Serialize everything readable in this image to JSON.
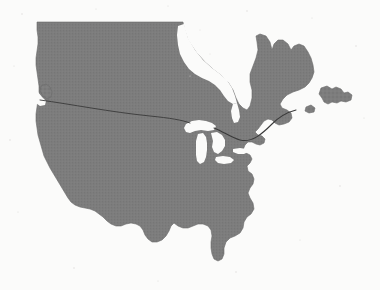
{
  "figure": {
    "kind": "map-silhouette",
    "width": 380,
    "height": 290,
    "projection_note": "contiguous United States with southern Canada"
  },
  "colors": {
    "background": "#fbfbfa",
    "land_fill": "#7d7d7d",
    "land_fill_shade": "#6f6f6f",
    "water_fill": "#fbfbfa",
    "border_line": "#3a3a3a",
    "texture_dot": "#6a6a6a",
    "speckle": "#d8d6d2"
  },
  "regions": {
    "landmass": {
      "name": "mainland",
      "label": "North American mainland"
    },
    "islands": [
      {
        "name": "vancouver-island",
        "label": "Vancouver Island"
      },
      {
        "name": "newfoundland",
        "label": "Newfoundland"
      }
    ],
    "water_bodies": [
      {
        "name": "hudson-bay",
        "label": "Hudson Bay"
      },
      {
        "name": "james-bay",
        "label": "James Bay"
      },
      {
        "name": "lake-superior",
        "label": "Lake Superior"
      },
      {
        "name": "lake-michigan",
        "label": "Lake Michigan"
      },
      {
        "name": "lake-huron",
        "label": "Lake Huron"
      },
      {
        "name": "lake-erie",
        "label": "Lake Erie"
      },
      {
        "name": "lake-ontario",
        "label": "Lake Ontario"
      },
      {
        "name": "puget-sound",
        "label": "Puget Sound"
      },
      {
        "name": "gulf-of-st-lawrence",
        "label": "Gulf of St. Lawrence"
      }
    ],
    "borders": [
      {
        "name": "forty-ninth-parallel",
        "label": "US-Canada western border"
      },
      {
        "name": "st-lawrence-border",
        "label": "US-Canada eastern border"
      }
    ]
  },
  "geometry": {
    "mainland_path": "M 37 22 L 183 22 L 184 28 L 188 40 L 196 52 L 205 62 L 214 70 L 222 76 L 228 82 L 233 90 L 236 98 L 239 104 L 243 108 L 247 110 L 250 106 L 252 98 L 252 90 L 250 82 L 250 74 L 253 66 L 256 58 L 258 50 L 257 42 L 256 36 L 260 34 L 266 36 L 270 42 L 272 50 L 274 44 L 278 40 L 283 40 L 288 44 L 291 50 L 294 46 L 299 44 L 304 46 L 308 52 L 311 58 L 313 65 L 314 72 L 312 78 L 309 83 L 305 87 L 299 90 L 293 92 L 287 95 L 283 99 L 280 104 L 282 108 L 287 110 L 291 113 L 292 118 L 289 122 L 284 124 L 279 125 L 275 123 L 272 120 L 268 119 L 264 121 L 261 125 L 258 129 L 255 132 L 258 135 L 262 136 L 265 139 L 264 143 L 260 145 L 256 144 L 252 142 L 248 142 L 245 145 L 243 150 L 246 153 L 250 155 L 252 159 L 250 163 L 247 166 L 248 171 L 252 174 L 254 179 L 253 184 L 250 188 L 248 193 L 250 198 L 253 203 L 254 209 L 251 214 L 247 217 L 244 222 L 243 228 L 240 233 L 235 236 L 230 238 L 226 242 L 224 248 L 224 254 L 222 259 L 218 261 L 214 259 L 212 254 L 211 248 L 211 242 L 212 236 L 211 230 L 208 226 L 203 224 L 198 224 L 193 226 L 188 228 L 183 228 L 178 226 L 174 223 L 171 226 L 169 231 L 166 236 L 162 240 L 157 242 L 152 242 L 148 239 L 145 235 L 143 230 L 140 226 L 136 224 L 131 223 L 126 224 L 121 226 L 116 226 L 111 224 L 107 221 L 103 217 L 99 214 L 95 211 L 90 209 L 85 208 L 80 207 L 75 205 L 71 202 L 68 198 L 65 193 L 62 188 L 59 183 L 56 178 L 53 173 L 50 168 L 47 162 L 44 156 L 42 149 L 40 142 L 38 135 L 37 128 L 36 121 L 36 114 L 37 107 L 38 100 L 39 93 L 39 86 L 38 79 L 37 72 L 36 65 L 36 58 L 37 51 L 38 44 L 38 37 L 37 30 Z",
    "hudson_bay_path": "M 184 24 L 188 38 L 195 50 L 203 60 L 212 68 L 220 74 L 227 80 L 232 88 L 235 96 L 237 103 L 233 104 L 228 101 L 224 96 L 220 90 L 215 85 L 209 81 L 202 78 L 195 74 L 189 69 L 184 62 L 180 54 L 178 45 L 177 35 L 178 26 Z",
    "james_bay_path": "M 233 104 L 237 103 L 239 110 L 240 117 L 238 122 L 234 123 L 232 118 L 231 111 Z",
    "lake_superior_path": "M 186 124 L 192 121 L 199 120 L 206 121 L 212 123 L 216 126 L 214 130 L 208 131 L 201 130 L 195 131 L 190 133 L 186 132 L 184 128 Z",
    "lake_michigan_path": "M 198 134 L 203 133 L 206 137 L 207 143 L 207 150 L 206 157 L 204 162 L 200 164 L 197 161 L 196 155 L 196 148 L 196 141 Z",
    "lake_huron_path": "M 211 133 L 217 132 L 222 135 L 225 140 L 225 146 L 222 151 L 218 154 L 214 152 L 212 147 L 213 141 L 212 137 Z",
    "lake_erie_path": "M 216 157 L 223 156 L 230 157 L 234 160 L 231 163 L 224 164 L 218 163 L 215 160 Z",
    "lake_ontario_path": "M 233 149 L 240 148 L 246 149 L 248 152 L 244 154 L 238 154 L 233 152 Z",
    "vancouver_island_path": "M 41 86 L 46 84 L 50 87 L 52 92 L 51 97 L 47 99 L 43 96 L 40 91 Z",
    "puget_sound_path": "M 38 92 L 42 97 L 46 101 L 45 105 L 40 106 L 36 103 L 35 97 Z",
    "newfoundland_path": "M 321 88 L 327 86 L 332 89 L 336 87 L 341 89 L 344 93 L 348 92 L 352 95 L 351 100 L 346 102 L 341 101 L 337 103 L 332 102 L 328 104 L 324 102 L 322 98 L 319 94 Z",
    "island_ne_small_path": "M 306 107 L 311 105 L 315 108 L 314 112 L 309 113 L 305 111 Z",
    "border_west_path": "M 40 100 C 70 104, 110 112, 150 116 C 170 118, 182 120, 190 123",
    "border_east_path": "M 214 128 C 224 132, 232 138, 240 140 C 252 143, 262 134, 272 124 C 280 116, 288 112, 296 110"
  }
}
